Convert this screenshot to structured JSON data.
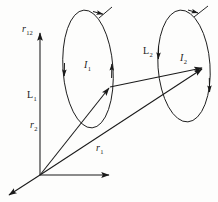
{
  "figure": {
    "background_color": "#fdfdfc",
    "stroke_color": "#1a1a1a"
  },
  "labels": {
    "r12": {
      "base": "r",
      "sub": "12",
      "name": "separation-vector-label"
    },
    "r1": {
      "base": "r",
      "sub": "1",
      "name": "position-vector-r1-label"
    },
    "r2": {
      "base": "r",
      "sub": "2",
      "name": "position-vector-r2-label"
    },
    "L1": {
      "base": "L",
      "sub": "1",
      "name": "loop-1-label"
    },
    "L2": {
      "base": "L",
      "sub": "2",
      "name": "loop-2-label"
    },
    "I1": {
      "base": "I",
      "sub": "1",
      "name": "current-1-label"
    },
    "I2": {
      "base": "I",
      "sub": "2",
      "name": "current-2-label"
    }
  },
  "geometry": {
    "origin": {
      "x": 40,
      "y": 175
    },
    "axes": [
      {
        "name": "vertical-axis",
        "x2": 40,
        "y2": 33
      },
      {
        "name": "horizontal-axis",
        "x2": 109,
        "y2": 175
      },
      {
        "name": "depth-axis",
        "x2": 8,
        "y2": 196
      }
    ],
    "loop1": {
      "cx": 88,
      "cy": 69,
      "rx": 25,
      "ry": 59,
      "rotation": -4
    },
    "loop2": {
      "cx": 184,
      "cy": 66,
      "rx": 26,
      "ry": 56,
      "rotation": -4
    },
    "vector_r2": {
      "x1": 40,
      "y1": 175,
      "x2": 110,
      "y2": 87
    },
    "vector_r1": {
      "x1": 40,
      "y1": 175,
      "x2": 203,
      "y2": 68
    },
    "vector_r12": {
      "x1": 110,
      "y1": 87,
      "x2": 203,
      "y2": 68
    }
  }
}
